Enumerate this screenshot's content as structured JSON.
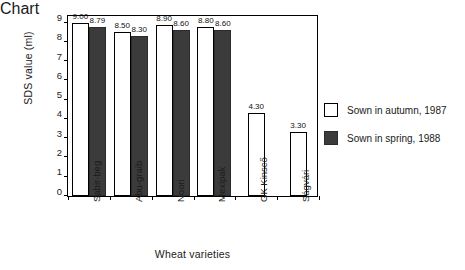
{
  "chart_data": {
    "type": "bar",
    "title": "",
    "xlabel": "Wheat varieties",
    "ylabel": "SDS value (ml)",
    "ylim": [
      0,
      9.45
    ],
    "yticks": [
      0,
      1,
      2,
      3,
      4,
      5,
      6,
      7,
      8,
      9
    ],
    "ytick_labels": [
      "0",
      "1",
      "2",
      "3",
      "4",
      "5",
      "6",
      "7",
      "8",
      "9"
    ],
    "grid": false,
    "legend_position": "right",
    "categories": [
      "Sabir-beg",
      "Abu-graib",
      "Noori",
      "Mexipak",
      "GK Kinscő",
      "Ságvári"
    ],
    "series": [
      {
        "name": "Sown in autumn, 1987",
        "color": "#ffffff",
        "values": [
          9.0,
          8.5,
          8.9,
          8.8,
          4.3,
          3.3
        ],
        "labels": [
          "9.00",
          "8.50",
          "8.90",
          "8.80",
          "4.30",
          "3.30"
        ]
      },
      {
        "name": "Sown in spring, 1988",
        "color": "#3b3b3b",
        "values": [
          8.79,
          8.3,
          8.6,
          8.6,
          null,
          null
        ],
        "labels": [
          "8.79",
          "8.30",
          "8.60",
          "8.60",
          "",
          ""
        ]
      }
    ]
  },
  "legend": {
    "items": [
      {
        "label": "Sown in autumn, 1987",
        "swatch": "autumn"
      },
      {
        "label": "Sown in spring, 1988",
        "swatch": "spring"
      }
    ]
  }
}
